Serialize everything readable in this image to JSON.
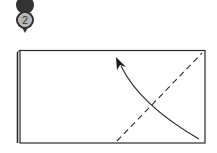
{
  "diagram": {
    "type": "origami-fold-instruction",
    "step": {
      "number": "2",
      "marker_color": "#333333",
      "marker_fill": "#b0b0b0"
    },
    "paper": {
      "shape": "rectangle",
      "layered": true,
      "fold_line": "valley-dashed-diagonal",
      "arrow": "curved-fold-direction"
    },
    "colors": {
      "line": "#2a2a2a",
      "paper": "#ffffff"
    }
  }
}
